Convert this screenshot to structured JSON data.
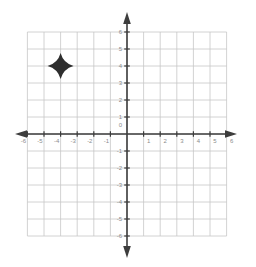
{
  "canvas": {
    "width": 256,
    "height": 267,
    "background": "#ffffff"
  },
  "chart_data": {
    "type": "scatter",
    "title": "",
    "xlabel": "",
    "ylabel": "",
    "xlim": [
      -6,
      6
    ],
    "ylim": [
      -6,
      6
    ],
    "grid": true,
    "legend": false,
    "xticks": [
      -6,
      -5,
      -4,
      -3,
      -2,
      -1,
      0,
      1,
      2,
      3,
      4,
      5,
      6
    ],
    "yticks": [
      -6,
      -5,
      -4,
      -3,
      -2,
      -1,
      0,
      1,
      2,
      3,
      4,
      5,
      6
    ],
    "origin_label": "0",
    "points": [
      {
        "x": -4,
        "y": 4,
        "marker": "four-pointed-star",
        "label": ""
      }
    ],
    "colors": {
      "background": "#ffffff",
      "grid": "#c6c6c6",
      "axis": "#3d3d3d",
      "tick_label": "#8c8c8c",
      "marker": "#2e2e2e"
    }
  }
}
